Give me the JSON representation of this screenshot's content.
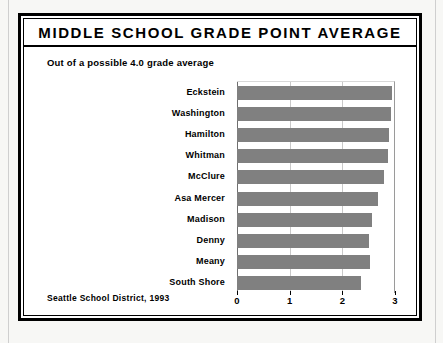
{
  "document": {
    "title": "MIDDLE SCHOOL GRADE POINT AVERAGE",
    "subtitle": "Out of a possible 4.0 grade average",
    "source_note": "Seattle School District, 1993"
  },
  "colors": {
    "bar_fill": "#808080",
    "frame": "#000000",
    "gridline": "#c9c9c9",
    "paper": "#ffffff"
  },
  "chart_data": {
    "type": "bar",
    "orientation": "horizontal",
    "title": "MIDDLE SCHOOL GRADE POINT AVERAGE",
    "subtitle": "Out of a possible 4.0 grade average",
    "source": "Seattle School District, 1993",
    "xlabel": "",
    "ylabel": "",
    "xlim": [
      0,
      3
    ],
    "xticks": [
      0,
      1,
      2,
      3
    ],
    "xtick_labels": [
      "0",
      "1",
      "2",
      "3"
    ],
    "grid": true,
    "legend": false,
    "categories": [
      "Eckstein",
      "Washington",
      "Hamilton",
      "Whitman",
      "McClure",
      "Asa Mercer",
      "Madison",
      "Denny",
      "Meany",
      "South Shore"
    ],
    "values": [
      2.95,
      2.92,
      2.88,
      2.86,
      2.8,
      2.67,
      2.57,
      2.5,
      2.52,
      2.35
    ],
    "bars": [
      {
        "label": "Eckstein",
        "value": 2.95
      },
      {
        "label": "Washington",
        "value": 2.92
      },
      {
        "label": "Hamilton",
        "value": 2.88
      },
      {
        "label": "Whitman",
        "value": 2.86
      },
      {
        "label": "McClure",
        "value": 2.8
      },
      {
        "label": "Asa Mercer",
        "value": 2.67
      },
      {
        "label": "Madison",
        "value": 2.57
      },
      {
        "label": "Denny",
        "value": 2.5
      },
      {
        "label": "Meany",
        "value": 2.52
      },
      {
        "label": "South Shore",
        "value": 2.35
      }
    ]
  }
}
